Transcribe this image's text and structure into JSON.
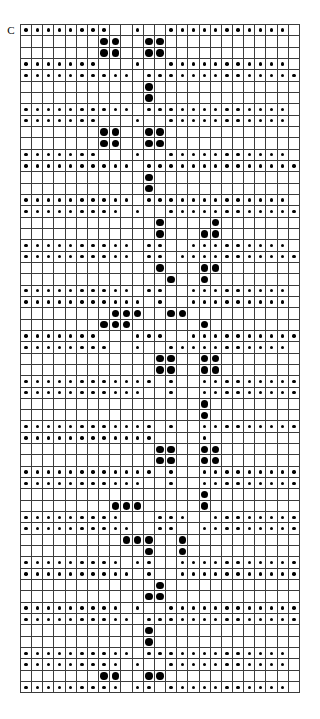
{
  "chart": {
    "label": "C",
    "columns": 25,
    "rows": 59,
    "symbols": {
      "empty": "",
      "small_dot": "s",
      "medium_dot": "m",
      "large_dot": "l"
    },
    "colors": {
      "background": "#ffffff",
      "grid_line": "#3c3c3c",
      "border": "#231f20",
      "symbol": "#000000"
    }
  },
  "chart_data": {
    "type": "heatmap",
    "title": "C",
    "xlabel": "",
    "ylabel": "",
    "grid": true,
    "legend": "none",
    "columns": 25,
    "rows": 59,
    "symbol_legend": [
      {
        "code": "s",
        "name": "small-dot"
      },
      {
        "code": "m",
        "name": "medium-dot"
      },
      {
        "code": "l",
        "name": "large-dot"
      },
      {
        "code": ".",
        "name": "empty-cell"
      }
    ],
    "matrix": [
      "ssssssss..s..sssssssssss.",
      ".......ll..ll............",
      ".......ll..ll............",
      "sssssss...s..sssssssssss.",
      "ssssssssss.ssssssssssssss",
      "...........l.............",
      "...........l.............",
      "ssssssssss.sssssssssssss.",
      "sssssss...s..sssssssssss.",
      ".......ll..ll............",
      ".......ll..ll............",
      "sssssss...s..sssssssssss.",
      "ssssssssss.ssssssssssssss",
      "...........l.............",
      "...........l.............",
      "ssssssssss.sssssssssssss.",
      "sssssssss.s..ssssssssssss",
      "............l....l.......",
      "............l...ll.......",
      "ssssssssss.ss..sssssssss.",
      "ssssssssss.ss.sssssssssss",
      "............l...ll.......",
      ".............l..l........",
      "ssssssssss.ss..sssssssss.",
      "sssssssssss.s..sssssssss.",
      "........lll..ll..........",
      ".......lll......l........",
      "sssssss...sss..ssssssssss",
      "ssssssss..s..sssssssssss.",
      "............ll..ll.......",
      "............ll..ll.......",
      "ssssssssssss.s..sssssssss",
      "sssssssssss..s..sssssssss",
      "................l........",
      "................l........",
      "ssssssssssss.s..sssssssss",
      "ssssssssssss....s........",
      "............ll..ll.......",
      "............ll..ll.......",
      "ssssssssssss.s..sssssssss",
      "sssssssssss..s..sssssssss",
      "................l........",
      "........lll.....l........",
      "sssssssss...sss..ssssssss",
      "ssssssssss..ss..ssssssssss",
      ".........lll..l..........",
      "...........l..l..........",
      "sssssssss.ss..sssssssssss",
      "ssssssssss.s..sssssssssss",
      "............l............",
      "...........ll............",
      "sssssssss.s..ssssssssssss",
      "ssssssssss.ssssssssssssss",
      "...........l.............",
      "...........l.............",
      "ssssssssss.sssssssssssss.",
      "sssssssss.s..sssssssssss.",
      ".......ll..ll............",
      "sssssssss.ss.sssssssssss."
    ]
  }
}
